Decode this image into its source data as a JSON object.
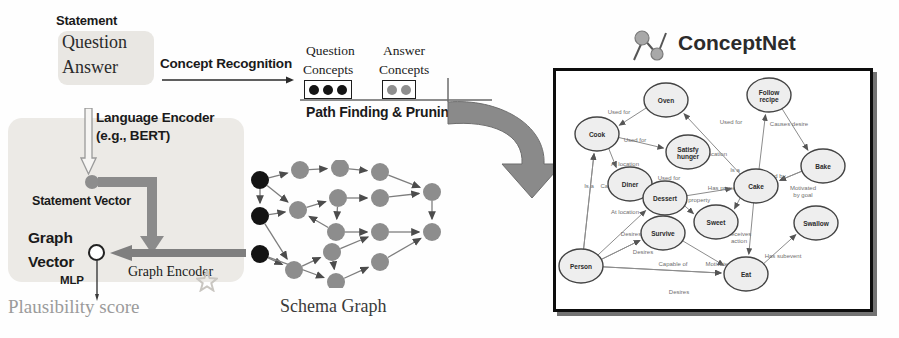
{
  "figure": {
    "left_panel": {
      "statement_label": "Statement",
      "question_text": "Question",
      "answer_text": "Answer",
      "language_encoder_line1": "Language Encoder",
      "language_encoder_line2": "(e.g., BERT)",
      "statement_vector_label": "Statement Vector",
      "graph_word": "Graph",
      "vector_word": "Vector",
      "graph_encoder_label": "Graph Encoder",
      "mlp_label": "MLP",
      "plausibility_label": "Plausibility score"
    },
    "pipeline": {
      "concept_recognition_label": "Concept Recognition",
      "question_concepts_line1": "Question",
      "question_concepts_line2": "Concepts",
      "answer_concepts_line1": "Answer",
      "answer_concepts_line2": "Concepts",
      "question_concept_dots": 3,
      "answer_concept_dots": 2,
      "path_finding_label": "Path Finding & Pruning"
    },
    "schema_graph": {
      "caption": "Schema Graph",
      "dark_node_color": "#141414",
      "gray_node_color": "#8d8d8d",
      "nodes": [
        {
          "id": "q1",
          "x": 14,
          "y": 20,
          "type": "dark"
        },
        {
          "id": "q2",
          "x": 14,
          "y": 56,
          "type": "dark"
        },
        {
          "id": "q3",
          "x": 14,
          "y": 94,
          "type": "dark"
        },
        {
          "id": "m1",
          "x": 54,
          "y": 10,
          "type": "gray"
        },
        {
          "id": "m2",
          "x": 52,
          "y": 50,
          "type": "gray"
        },
        {
          "id": "m3",
          "x": 48,
          "y": 110,
          "type": "gray"
        },
        {
          "id": "m4",
          "x": 94,
          "y": 8,
          "type": "gray"
        },
        {
          "id": "m5",
          "x": 92,
          "y": 38,
          "type": "gray"
        },
        {
          "id": "m6",
          "x": 90,
          "y": 72,
          "type": "gray"
        },
        {
          "id": "m7",
          "x": 86,
          "y": 92,
          "type": "gray"
        },
        {
          "id": "m8",
          "x": 90,
          "y": 122,
          "type": "gray"
        },
        {
          "id": "m9",
          "x": 134,
          "y": 12,
          "type": "gray"
        },
        {
          "id": "m10",
          "x": 134,
          "y": 38,
          "type": "gray"
        },
        {
          "id": "m11",
          "x": 134,
          "y": 72,
          "type": "gray"
        },
        {
          "id": "m12",
          "x": 134,
          "y": 102,
          "type": "gray"
        },
        {
          "id": "a1",
          "x": 186,
          "y": 32,
          "type": "gray"
        },
        {
          "id": "a2",
          "x": 186,
          "y": 72,
          "type": "gray"
        }
      ]
    },
    "conceptnet": {
      "title": "ConceptNet",
      "nodes": [
        {
          "id": "oven",
          "label": "Oven",
          "x": 113,
          "y": 32
        },
        {
          "id": "follow",
          "label": "Follow\nrecipe",
          "x": 216,
          "y": 27
        },
        {
          "id": "cook",
          "label": "Cook",
          "x": 44,
          "y": 66
        },
        {
          "id": "satisfy",
          "label": "Satisfy\nhunger",
          "x": 135,
          "y": 84
        },
        {
          "id": "bake",
          "label": "Bake",
          "x": 270,
          "y": 98
        },
        {
          "id": "diner",
          "label": "Diner",
          "x": 77,
          "y": 116
        },
        {
          "id": "dessert",
          "label": "Dessert",
          "x": 112,
          "y": 130
        },
        {
          "id": "cake",
          "label": "Cake",
          "x": 203,
          "y": 118
        },
        {
          "id": "sweet",
          "label": "Sweet",
          "x": 163,
          "y": 154
        },
        {
          "id": "survive",
          "label": "Survive",
          "x": 110,
          "y": 165
        },
        {
          "id": "swallow",
          "label": "Swallow",
          "x": 263,
          "y": 155
        },
        {
          "id": "person",
          "label": "Person",
          "x": 28,
          "y": 198
        },
        {
          "id": "eat",
          "label": "Eat",
          "x": 193,
          "y": 206
        }
      ],
      "edges": [
        {
          "from": "oven",
          "to": "cook",
          "label": "Used for",
          "lx": 66,
          "ly": 46
        },
        {
          "from": "cook",
          "to": "satisfy",
          "label": "Used for",
          "lx": 82,
          "ly": 74
        },
        {
          "from": "cook",
          "to": "diner",
          "label": "At location",
          "lx": 72,
          "ly": 98
        },
        {
          "from": "cake",
          "to": "oven",
          "label": "At location",
          "lx": 160,
          "ly": 88
        },
        {
          "from": "cake",
          "to": "follow",
          "label": "Used for",
          "lx": 178,
          "ly": 56
        },
        {
          "from": "follow",
          "to": "bake",
          "label": "Causes desire",
          "lx": 236,
          "ly": 58
        },
        {
          "from": "bake",
          "to": "cake",
          "label": "Created by",
          "lx": 218,
          "ly": 110
        },
        {
          "from": "bake",
          "to": "cake",
          "label": "Motivated\nby goal",
          "lx": 250,
          "ly": 122
        },
        {
          "from": "diner",
          "to": "dessert",
          "label": "Used for",
          "lx": 116,
          "ly": 112
        },
        {
          "from": "dessert",
          "to": "cake",
          "label": "Is a",
          "lx": 182,
          "ly": 104
        },
        {
          "from": "dessert",
          "to": "sweet",
          "label": "Has property",
          "lx": 140,
          "ly": 134
        },
        {
          "from": "cake",
          "to": "sweet",
          "label": "Has property",
          "lx": 172,
          "ly": 122
        },
        {
          "from": "cake",
          "to": "eat",
          "label": "Receives\naction",
          "lx": 186,
          "ly": 168
        },
        {
          "from": "eat",
          "to": "swallow",
          "label": "Has subevent",
          "lx": 230,
          "ly": 190
        },
        {
          "from": "person",
          "to": "cook",
          "label": "Is a",
          "lx": 36,
          "ly": 120
        },
        {
          "from": "person",
          "to": "cook",
          "label": "Capable of",
          "lx": 62,
          "ly": 120
        },
        {
          "from": "person",
          "to": "dessert",
          "label": "At location",
          "lx": 72,
          "ly": 146
        },
        {
          "from": "person",
          "to": "survive",
          "label": "Desires",
          "lx": 78,
          "ly": 168
        },
        {
          "from": "person",
          "to": "survive",
          "label": "Desires",
          "lx": 90,
          "ly": 186
        },
        {
          "from": "person",
          "to": "eat",
          "label": "Capable of",
          "lx": 120,
          "ly": 198
        },
        {
          "from": "person",
          "to": "eat",
          "label": "Desires",
          "lx": 126,
          "ly": 226
        },
        {
          "from": "survive",
          "to": "eat",
          "label": "Motivated by goal",
          "lx": 176,
          "ly": 198
        }
      ]
    }
  }
}
